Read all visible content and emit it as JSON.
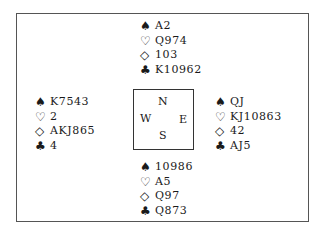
{
  "diagram": {
    "type": "bridge-deal",
    "suit_symbols": {
      "spades": "♠",
      "hearts": "♡",
      "diamonds": "◇",
      "clubs": "♣"
    },
    "compass": {
      "north": "N",
      "south": "S",
      "west": "W",
      "east": "E"
    },
    "hands": {
      "north": {
        "spades": "A2",
        "hearts": "Q974",
        "diamonds": "103",
        "clubs": "K10962"
      },
      "west": {
        "spades": "K7543",
        "hearts": "2",
        "diamonds": "AKJ865",
        "clubs": "4"
      },
      "east": {
        "spades": "QJ",
        "hearts": "KJ10863",
        "diamonds": "42",
        "clubs": "AJ5"
      },
      "south": {
        "spades": "10986",
        "hearts": "A5",
        "diamonds": "Q97",
        "clubs": "Q873"
      }
    }
  }
}
